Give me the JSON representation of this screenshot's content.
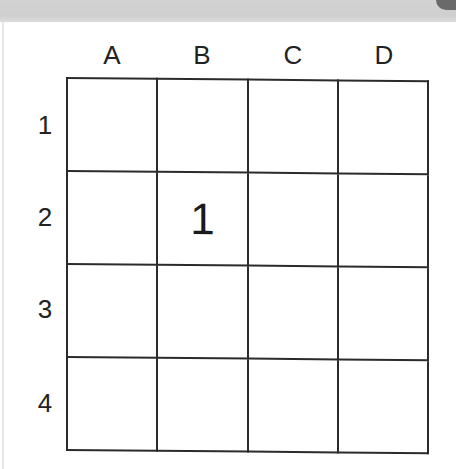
{
  "grid": {
    "columns": [
      "A",
      "B",
      "C",
      "D"
    ],
    "rows": [
      "1",
      "2",
      "3",
      "4"
    ],
    "cells": [
      [
        "",
        "",
        "",
        ""
      ],
      [
        "",
        "1",
        "",
        ""
      ],
      [
        "",
        "",
        "",
        ""
      ],
      [
        "",
        "",
        "",
        ""
      ]
    ]
  },
  "colors": {
    "line": "#2b2b2b",
    "text": "#222222",
    "background": "#ffffff",
    "top_band": "#d2d2d2"
  }
}
